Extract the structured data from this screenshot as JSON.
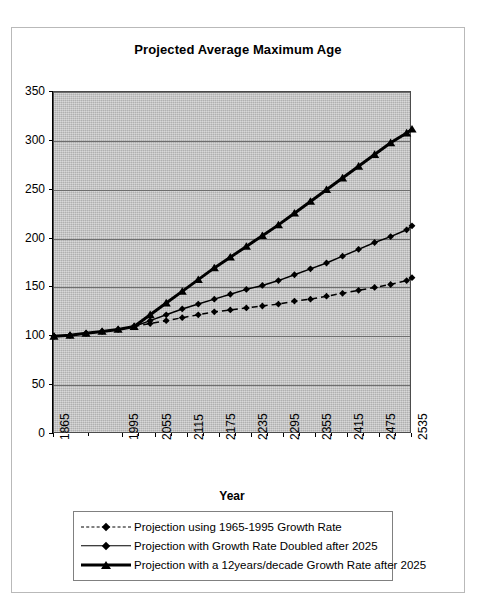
{
  "chart_data": {
    "type": "line",
    "title": "Projected Average Maximum Age",
    "xlabel": "Year",
    "ylabel": "",
    "grid": true,
    "legend_position": "bottom",
    "plot_background": "#c0c0c0",
    "ylim": [
      0,
      350
    ],
    "yticks": [
      0,
      50,
      100,
      150,
      200,
      250,
      300,
      350
    ],
    "xlim": [
      1865,
      2535
    ],
    "xticks": [
      1865,
      1995,
      2055,
      2115,
      2175,
      2235,
      2295,
      2355,
      2415,
      2475,
      2535
    ],
    "x": [
      1865,
      1895,
      1925,
      1955,
      1985,
      2015,
      2045,
      2075,
      2105,
      2135,
      2165,
      2195,
      2225,
      2255,
      2285,
      2315,
      2345,
      2375,
      2405,
      2435,
      2465,
      2495,
      2525,
      2535
    ],
    "series": [
      {
        "name": "Projection using 1965-1995 Growth Rate",
        "style": "dashed",
        "marker": "diamond",
        "width": 1.5,
        "color": "#000000",
        "values": [
          100,
          101,
          103,
          105,
          107,
          110,
          113,
          116,
          119,
          122,
          125,
          127,
          129,
          131,
          133,
          136,
          138,
          141,
          144,
          147,
          150,
          153,
          157,
          160
        ]
      },
      {
        "name": "Projection with Growth Rate Doubled after 2025",
        "style": "solid",
        "marker": "diamond",
        "width": 1.5,
        "color": "#000000",
        "values": [
          100,
          101,
          103,
          105,
          107,
          110,
          116,
          122,
          128,
          133,
          138,
          143,
          148,
          152,
          157,
          163,
          169,
          175,
          182,
          189,
          196,
          202,
          209,
          213
        ]
      },
      {
        "name": "Projection with a 12years/decade Growth Rate after 2025",
        "style": "solid",
        "marker": "triangle",
        "width": 3,
        "color": "#000000",
        "values": [
          100,
          101,
          103,
          105,
          107,
          110,
          122,
          134,
          146,
          158,
          170,
          181,
          192,
          203,
          214,
          226,
          238,
          250,
          262,
          274,
          286,
          298,
          308,
          312
        ]
      }
    ]
  },
  "legend": {
    "items": [
      {
        "label": "Projection using 1965-1995 Growth Rate",
        "style": "dashed",
        "marker": "diamond",
        "thickness": "thin"
      },
      {
        "label": "Projection with Growth Rate Doubled after 2025",
        "style": "solid",
        "marker": "diamond",
        "thickness": "thin"
      },
      {
        "label": "Projection with a 12years/decade Growth Rate after 2025",
        "style": "solid",
        "marker": "triangle",
        "thickness": "thick"
      }
    ]
  }
}
